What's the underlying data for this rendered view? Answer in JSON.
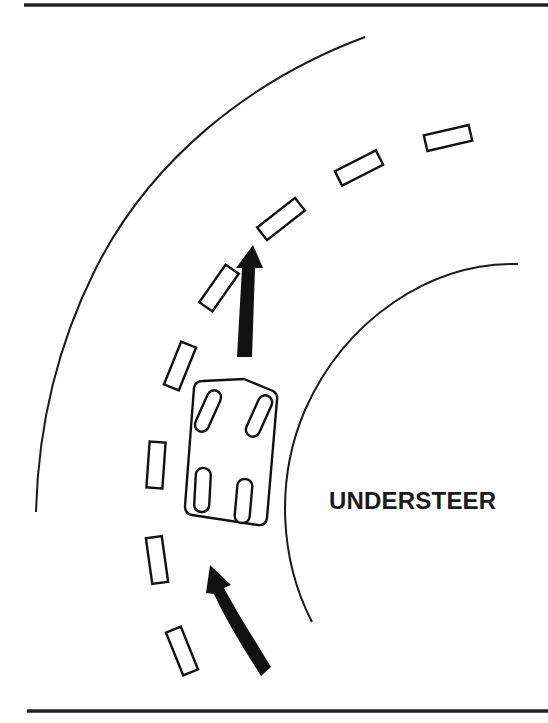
{
  "diagram": {
    "title_label": "UNDERSTEER",
    "colors": {
      "ink": "#111111",
      "background": "#ffffff"
    },
    "elements": {
      "top_rule": "horizontal-rule",
      "bottom_rule": "horizontal-rule",
      "outer_road_edge": "curve",
      "inner_road_edge": "curve",
      "center_lane_dashes_count": 10,
      "car": "car-with-four-wheels",
      "steering_arrow": "straight-up-arrow",
      "path_arrow": "curved-arrow"
    }
  }
}
